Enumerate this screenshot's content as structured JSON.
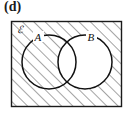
{
  "figure": {
    "part_label": "(d)",
    "caption_present": false,
    "type": "venn-diagram"
  },
  "diagram": {
    "universe": {
      "name": "universal-set",
      "symbol": "ℰ",
      "shape": "rectangle",
      "shaded": true,
      "x": 11,
      "y": 21,
      "width": 111,
      "height": 86,
      "stroke_color": "#1a1a1a",
      "fill_color": "#ffffff"
    },
    "sets": [
      {
        "id": "A",
        "label": "A",
        "shape": "circle",
        "cx": 49,
        "cy": 62,
        "r": 27,
        "shaded": true,
        "label_x": 38,
        "label_y": 40,
        "stroke_color": "#111111"
      },
      {
        "id": "B",
        "label": "B",
        "shape": "circle",
        "cx": 85,
        "cy": 62,
        "r": 27,
        "shaded": false,
        "label_x": 90,
        "label_y": 40,
        "stroke_color": "#111111"
      }
    ],
    "regions": [
      {
        "name": "outside-both",
        "expression": "(A ∪ B)'",
        "shaded": true
      },
      {
        "name": "only-A",
        "expression": "A ∩ B'",
        "shaded": true
      },
      {
        "name": "intersection",
        "expression": "A ∩ B",
        "shaded": false
      },
      {
        "name": "only-B",
        "expression": "B ∩ A'",
        "shaded": false
      }
    ],
    "shaded_expression": "B'",
    "hatch": {
      "angle_degrees": 45,
      "direction": "lower-left-to-upper-right",
      "spacing_px": 8,
      "line_width_px": 1,
      "color": "#4a4a4a"
    }
  },
  "colors": {
    "ink": "#111111",
    "hatch": "#4a4a4a",
    "paper": "#ffffff",
    "border": "#1a1a1a"
  }
}
